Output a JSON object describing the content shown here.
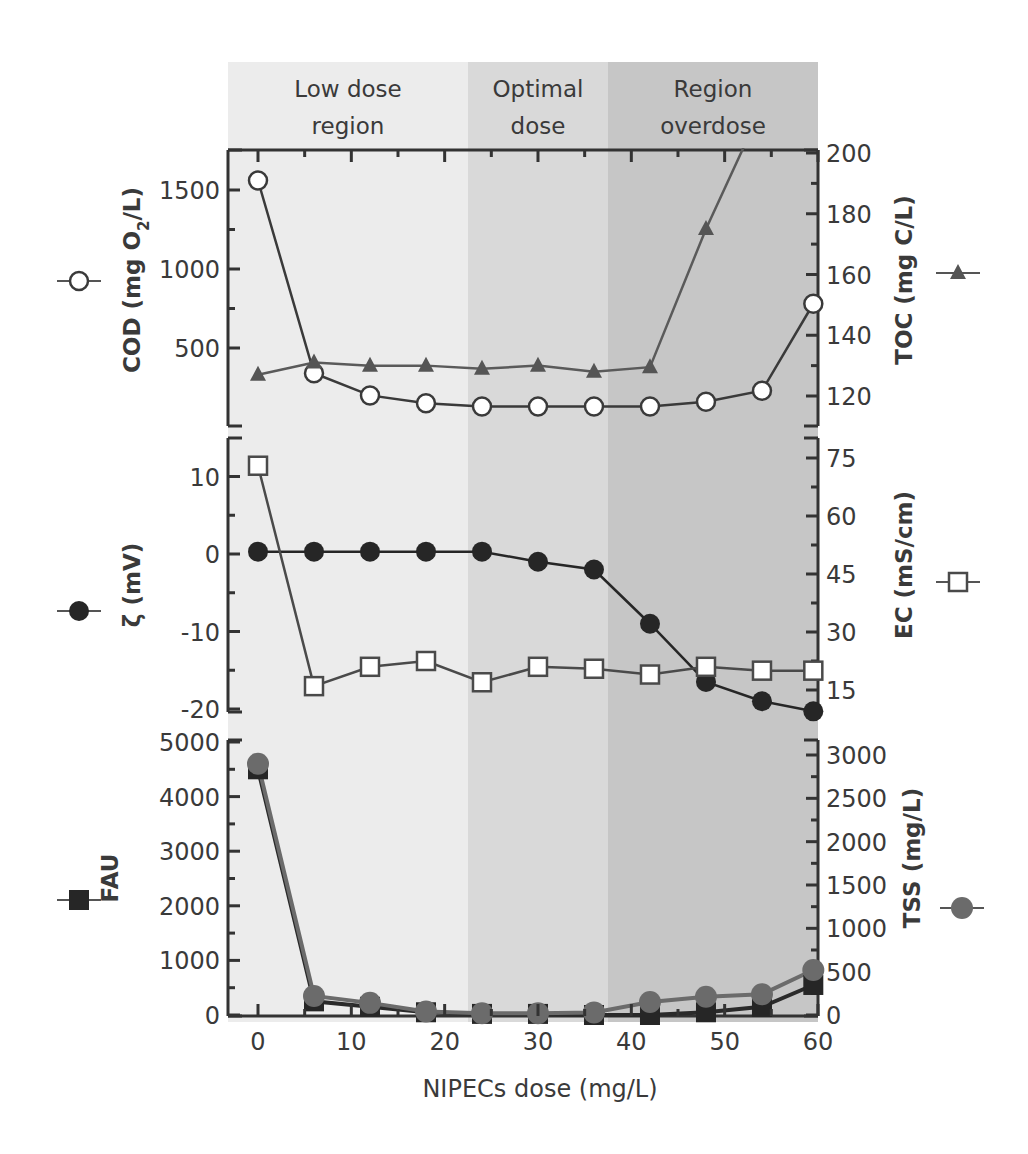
{
  "chart_data": {
    "type": "line",
    "layout": "three stacked panels sharing x-axis, each with dual y-axes",
    "xlabel": "NIPECs dose (mg/L)",
    "x_ticks": [
      0,
      10,
      20,
      30,
      40,
      50,
      60
    ],
    "xlim": [
      -3,
      60
    ],
    "x": [
      0,
      6,
      12,
      18,
      24,
      30,
      36,
      42,
      48,
      54,
      59.5
    ],
    "regions": [
      {
        "label_line1": "Low dose",
        "label_line2": "region",
        "x_start": -3,
        "x_end": 22.5,
        "color": "#ececec"
      },
      {
        "label_line1": "Optimal",
        "label_line2": "dose",
        "x_start": 22.5,
        "x_end": 37.5,
        "color": "#d9d9d9"
      },
      {
        "label_line1": "Region",
        "label_line2": "overdose",
        "x_start": 37.5,
        "x_end": 60,
        "color": "#c6c6c6"
      }
    ],
    "panels": [
      {
        "name": "top",
        "left_axis": {
          "label": "COD (mg O2/L)",
          "label_main": "COD (mg O",
          "label_sub": "2",
          "label_tail": "/L)",
          "ticks": [
            500,
            1000,
            1500
          ],
          "ylim": [
            0,
            1750
          ]
        },
        "right_axis": {
          "label": "TOC (mg C/L)",
          "ticks": [
            120,
            140,
            160,
            180,
            200
          ],
          "ylim": [
            110,
            200
          ]
        },
        "series": [
          {
            "name": "COD",
            "axis": "left",
            "marker": "open-circle",
            "color": "#3a3a3a",
            "values": [
              1560,
              340,
              200,
              150,
              130,
              130,
              130,
              130,
              160,
              230,
              780
            ]
          },
          {
            "name": "TOC",
            "axis": "right",
            "marker": "filled-triangle",
            "color": "#5a5a5a",
            "values": [
              127,
              131,
              130,
              130,
              129,
              130,
              128,
              129.5,
              175,
              215,
              null
            ]
          }
        ]
      },
      {
        "name": "middle",
        "left_axis": {
          "label": "ζ (mV)",
          "ticks": [
            -20,
            -10,
            0,
            10
          ],
          "ylim": [
            -20.5,
            15
          ]
        },
        "right_axis": {
          "label": "EC (mS/cm)",
          "ticks": [
            15,
            30,
            45,
            60,
            75
          ],
          "ylim": [
            9,
            80
          ]
        },
        "series": [
          {
            "name": "ζ",
            "axis": "left",
            "marker": "filled-circle",
            "color": "#262626",
            "values": [
              0.3,
              0.3,
              0.3,
              0.3,
              0.3,
              -1,
              -2,
              -9,
              -16.5,
              -19,
              -20.3
            ]
          },
          {
            "name": "EC",
            "axis": "right",
            "marker": "open-square",
            "color": "#4a4a4a",
            "values": [
              73,
              16,
              21,
              22.5,
              17,
              21,
              20.5,
              19,
              21,
              20,
              20
            ]
          }
        ]
      },
      {
        "name": "bottom",
        "left_axis": {
          "label": "FAU",
          "ticks": [
            0,
            1000,
            2000,
            3000,
            4000,
            5000
          ],
          "ylim": [
            0,
            5000
          ]
        },
        "right_axis": {
          "label": "TSS (mg/L)",
          "ticks": [
            0,
            500,
            1000,
            1500,
            2000,
            2500,
            3000
          ],
          "ylim": [
            0,
            3000
          ]
        },
        "series": [
          {
            "name": "FAU",
            "axis": "left",
            "marker": "filled-square",
            "color": "#2a2a2a",
            "values": [
              4500,
              250,
              150,
              50,
              20,
              20,
              0,
              0,
              50,
              150,
              550
            ]
          },
          {
            "name": "TSS",
            "axis": "right",
            "marker": "filled-circle-gray",
            "color": "#6b6b6b",
            "values": [
              2900,
              220,
              140,
              40,
              20,
              20,
              30,
              150,
              210,
              240,
              520
            ]
          }
        ]
      }
    ],
    "legend": {
      "COD": "open-circle marker on left",
      "TOC": "filled-triangle marker on right",
      "ζ": "filled-circle marker on left",
      "EC": "open-square marker on right",
      "FAU": "filled-square marker on left",
      "TSS": "filled-gray-circle marker on right"
    },
    "grid": false
  }
}
